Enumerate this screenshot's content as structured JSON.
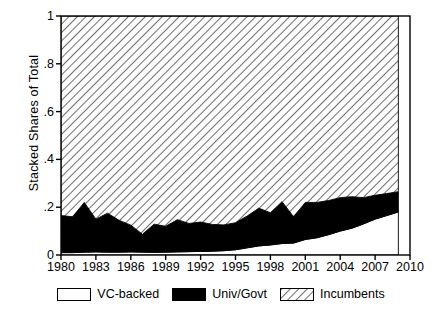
{
  "chart_data": {
    "type": "area",
    "title": "",
    "subtitle": "",
    "xlabel": "",
    "ylabel": "Stacked Shares of Total",
    "stacked": true,
    "normalized": true,
    "grid": false,
    "legend_position": "bottom",
    "xlim": [
      1980,
      2010
    ],
    "ylim": [
      0,
      1
    ],
    "x_ticks": [
      "1980",
      "1983",
      "1986",
      "1989",
      "1992",
      "1995",
      "1998",
      "2001",
      "2004",
      "2007",
      "2010"
    ],
    "x_tick_values": [
      1980,
      1983,
      1986,
      1989,
      1992,
      1995,
      1998,
      2001,
      2004,
      2007,
      2010
    ],
    "y_ticks": [
      "0",
      ".2",
      ".4",
      ".6",
      ".8",
      "1"
    ],
    "y_tick_values": [
      0,
      0.2,
      0.4,
      0.6,
      0.8,
      1
    ],
    "x": [
      1980,
      1981,
      1982,
      1983,
      1984,
      1985,
      1986,
      1987,
      1988,
      1989,
      1990,
      1991,
      1992,
      1993,
      1994,
      1995,
      1996,
      1997,
      1998,
      1999,
      2000,
      2001,
      2002,
      2003,
      2004,
      2005,
      2006,
      2007,
      2008,
      2009
    ],
    "series": [
      {
        "name": "VC-backed",
        "fill": "white",
        "values": [
          0.01,
          0.01,
          0.012,
          0.013,
          0.012,
          0.012,
          0.013,
          0.012,
          0.011,
          0.012,
          0.013,
          0.014,
          0.015,
          0.016,
          0.018,
          0.022,
          0.03,
          0.038,
          0.042,
          0.048,
          0.05,
          0.065,
          0.072,
          0.085,
          0.1,
          0.112,
          0.13,
          0.15,
          0.165,
          0.18
        ]
      },
      {
        "name": "Univ/Govt",
        "fill": "black",
        "values": [
          0.155,
          0.15,
          0.208,
          0.137,
          0.163,
          0.133,
          0.112,
          0.075,
          0.118,
          0.108,
          0.135,
          0.118,
          0.123,
          0.112,
          0.108,
          0.113,
          0.133,
          0.158,
          0.135,
          0.175,
          0.11,
          0.155,
          0.148,
          0.143,
          0.14,
          0.132,
          0.11,
          0.1,
          0.092,
          0.085
        ]
      },
      {
        "name": "Incumbents",
        "fill": "hatch",
        "values": [
          0.835,
          0.84,
          0.78,
          0.85,
          0.825,
          0.855,
          0.875,
          0.913,
          0.871,
          0.88,
          0.852,
          0.868,
          0.862,
          0.872,
          0.874,
          0.865,
          0.837,
          0.804,
          0.823,
          0.777,
          0.84,
          0.78,
          0.78,
          0.772,
          0.76,
          0.756,
          0.76,
          0.75,
          0.743,
          0.735
        ]
      }
    ]
  },
  "legend": {
    "items": [
      {
        "label": "VC-backed",
        "swatch": "empty"
      },
      {
        "label": "Univ/Govt",
        "swatch": "solid"
      },
      {
        "label": "Incumbents",
        "swatch": "hatch"
      }
    ]
  }
}
